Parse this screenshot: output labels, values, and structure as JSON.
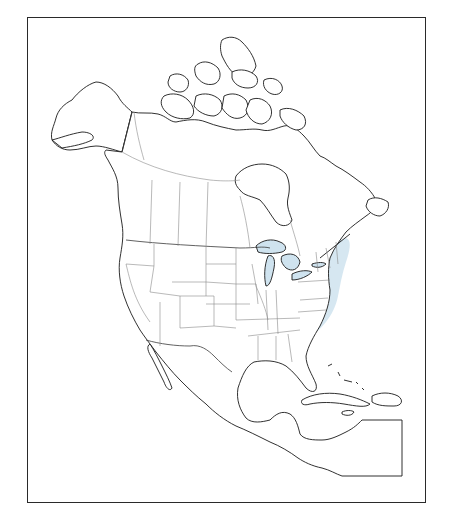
{
  "map": {
    "type": "range map",
    "region": "North America",
    "range_color": "#cfe3ef",
    "coastline_color": "#1a1a1a",
    "boundary_color": "#8a8a8a",
    "frame_color": "#2a2a2a",
    "range_areas": [
      {
        "name": "western-range",
        "description": "Western interior: southern Alberta/Saskatchewan, Montana, Idaho, Wyoming, Oregon, Nevada, Utah, Colorado, northern Arizona"
      },
      {
        "name": "eastern-range",
        "description": "Eastern: southern Quebec/Ontario, New England, New York, Pennsylvania, Virginia, Carolinas, Great Lakes shores"
      }
    ]
  }
}
